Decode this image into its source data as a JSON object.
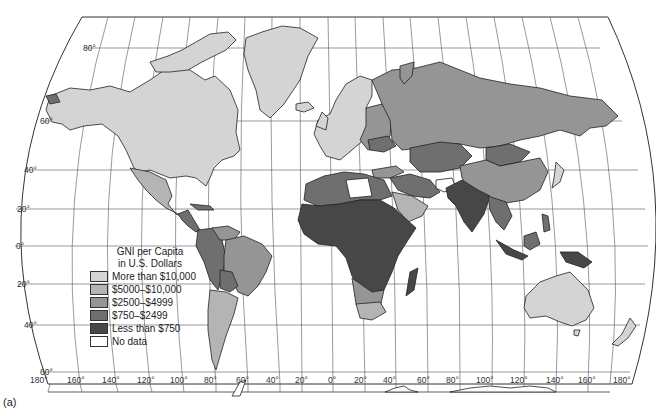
{
  "map": {
    "title": "GNI per Capita in U.S. Dollars",
    "panel_label": "(a)",
    "projection": "Robinson-like pseudo-cylindrical world map",
    "latitude_labels": [
      "80°",
      "60°",
      "40°",
      "20°",
      "0°",
      "20°",
      "40°",
      "60°"
    ],
    "longitude_labels": [
      "180°",
      "160°",
      "140°",
      "120°",
      "100°",
      "80°",
      "60°",
      "40°",
      "20°",
      "0°",
      "20°",
      "40°",
      "60°",
      "80°",
      "100°",
      "120°",
      "140°",
      "160°",
      "180°"
    ]
  },
  "legend": {
    "title_line1": "GNI per Capita",
    "title_line2": "in U.S. Dollars",
    "items": [
      {
        "label": "More than $10,000",
        "color": "#d4d4d4"
      },
      {
        "label": "$5000–$10,000",
        "color": "#b4b4b4"
      },
      {
        "label": "$2500–$4999",
        "color": "#959595"
      },
      {
        "label": "$750–$2499",
        "color": "#6f6f6f"
      },
      {
        "label": "Less than $750",
        "color": "#474747"
      },
      {
        "label": "No data",
        "color": "#ffffff"
      }
    ]
  },
  "regions": {
    "north_america": "More than $10,000",
    "greenland": "More than $10,000",
    "mexico": "$5000–$10,000",
    "central_america": "$750–$2499",
    "south_america_brazil": "$2500–$4999",
    "south_america_argentina_chile": "$5000–$10,000",
    "andean_countries": "$750–$2499",
    "western_europe": "More than $10,000",
    "eastern_europe": "$2500–$4999",
    "russia": "$2500–$4999",
    "china": "$2500–$4999",
    "mongolia": "$750–$2499",
    "central_asia": "$750–$2499",
    "india_south_asia": "Less than $750",
    "middle_east_gulf": "$5000–$10,000",
    "north_africa": "$750–$2499",
    "sub_saharan_africa": "Less than $750",
    "southern_africa": "$2500–$4999",
    "southeast_asia": "$750–$2499",
    "australia": "More than $10,000",
    "new_zealand": "More than $10,000",
    "japan": "More than $10,000",
    "afghanistan": "No data",
    "libya": "No data"
  }
}
